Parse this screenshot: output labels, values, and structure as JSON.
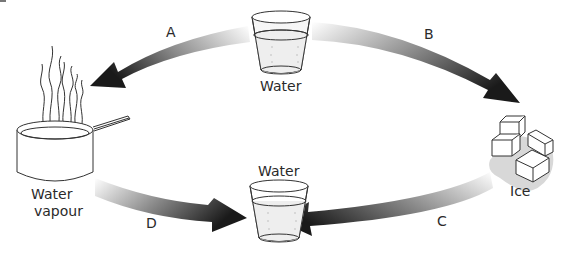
{
  "diagram": {
    "title": "",
    "nodes": {
      "top_water": {
        "label": "Water"
      },
      "pan": {
        "label_line1": "Water",
        "label_line2": "vapour"
      },
      "ice": {
        "label": "Ice"
      },
      "bottom_water": {
        "label": "Water"
      }
    },
    "arrows": [
      {
        "id": "A",
        "label": "A",
        "from": "Water",
        "to": "Water vapour"
      },
      {
        "id": "B",
        "label": "B",
        "from": "Water",
        "to": "Ice"
      },
      {
        "id": "C",
        "label": "C",
        "from": "Ice",
        "to": "Water"
      },
      {
        "id": "D",
        "label": "D",
        "from": "Water vapour",
        "to": "Water"
      }
    ],
    "colors": {
      "arrow_dark": "#1a1a1a",
      "arrow_light": "#e8e8e8",
      "text": "#2a2a2a",
      "line": "#333333"
    }
  }
}
